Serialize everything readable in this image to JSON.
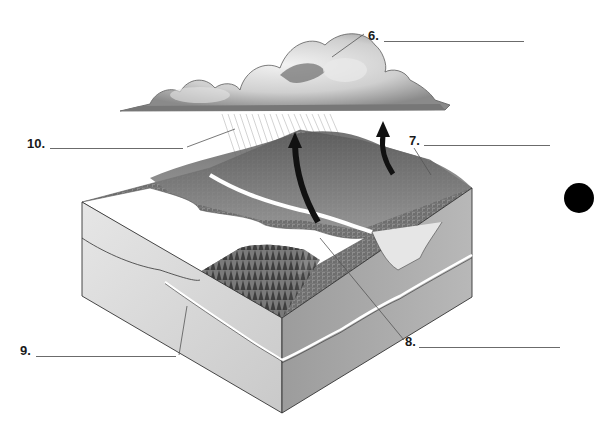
{
  "diagram": {
    "type": "water-cycle block diagram worksheet",
    "elements": {
      "cloud": "cumulus rain cloud",
      "rain": "precipitation streaks below cloud",
      "arrows": [
        "evaporation/transpiration arrow (large, over lake)",
        "evaporation/transpiration arrow (small, from hills)"
      ],
      "landscape": "forested hills with lake, river valley, and cross-section of soil and bedrock",
      "marker": "black filled circle on right"
    },
    "labels": [
      {
        "id": "6",
        "text": "6.",
        "answer": ""
      },
      {
        "id": "7",
        "text": "7.",
        "answer": ""
      },
      {
        "id": "8",
        "text": "8.",
        "answer": ""
      },
      {
        "id": "9",
        "text": "9.",
        "answer": ""
      },
      {
        "id": "10",
        "text": "10.",
        "answer": ""
      }
    ],
    "colors": {
      "ink": "#1a1a1a",
      "line": "#6b6b6b",
      "block_left_face": "#d8d8d8",
      "block_right_face": "#a9a9a9",
      "vegetation": "#6f6f6f",
      "water": "#ffffff"
    }
  }
}
